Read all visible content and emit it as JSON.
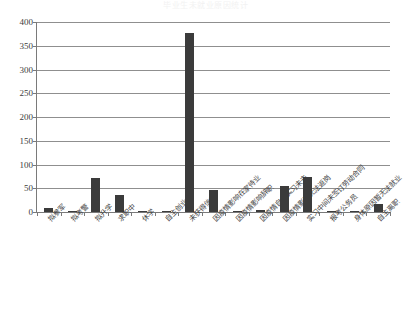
{
  "chart_data": {
    "type": "bar",
    "title": "毕业生未就业原因统计",
    "xlabel": "",
    "ylabel": "",
    "ylim": [
      0,
      400
    ],
    "yticks": [
      0,
      50,
      100,
      150,
      200,
      250,
      300,
      350,
      400
    ],
    "ytick_labels": [
      "0",
      "50",
      "100",
      "150",
      "200",
      "250",
      "300",
      "350",
      "400"
    ],
    "grid": true,
    "legend": false,
    "bar_color": "#3b3b3b",
    "categories": [
      "拟参军",
      "拟考警",
      "拟升学",
      "求职中",
      "休学",
      "自主创业",
      "未获得信息",
      "因疫情影响在家待业",
      "因疫情影响辞职",
      "因疫情自主实习未去",
      "因疫情影响无法返岗",
      "实习中间未签订劳动合同",
      "报考公务员",
      "身体原因暂无法就业",
      "自主离职"
    ],
    "values": [
      8,
      1,
      72,
      36,
      3,
      1,
      377,
      46,
      2,
      5,
      55,
      73,
      1,
      1,
      17
    ]
  }
}
